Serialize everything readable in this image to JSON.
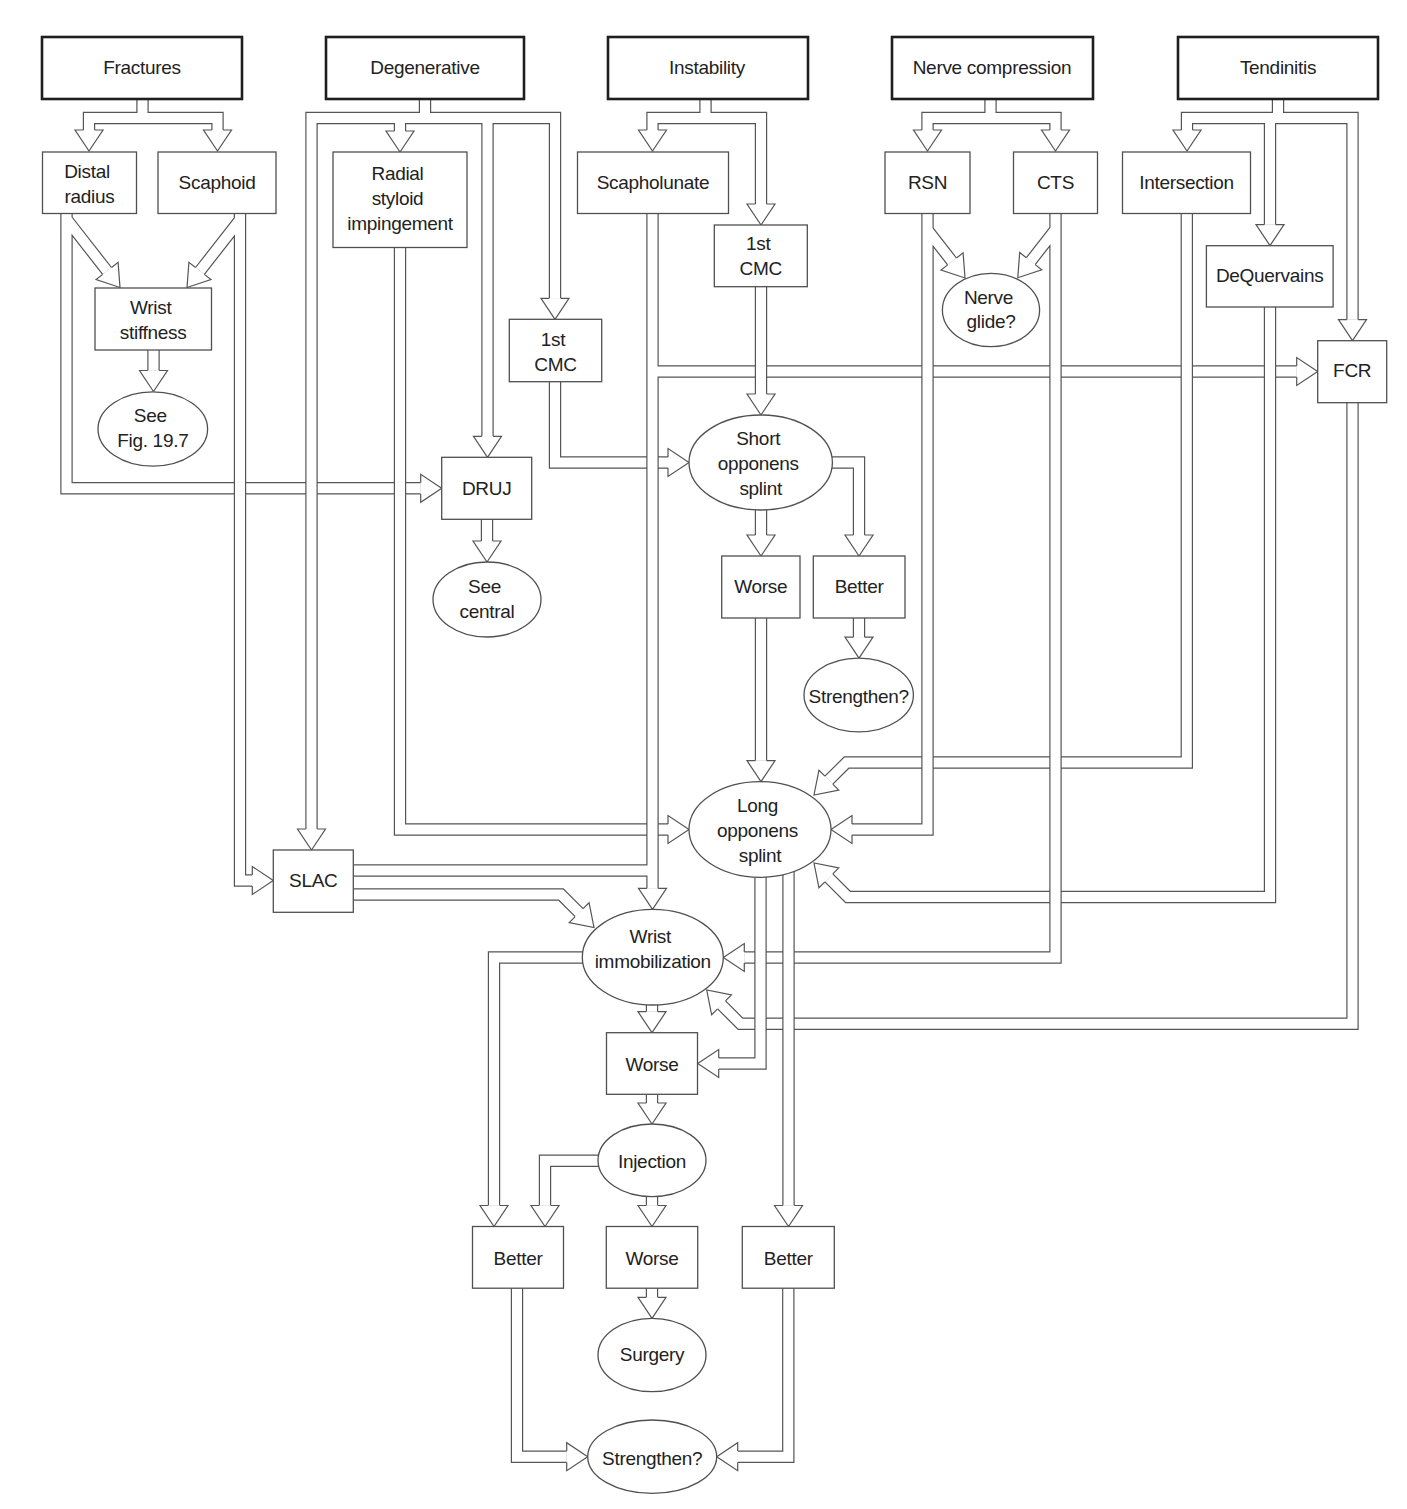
{
  "colors": {
    "background": "#ffffff",
    "connector_line": "#555555",
    "category_border": "#1e1e1e",
    "text": "#222222"
  },
  "nodes": {
    "fractures": {
      "shape": "rect",
      "level": "category",
      "lines": [
        "Fractures"
      ]
    },
    "degenerative": {
      "shape": "rect",
      "level": "category",
      "lines": [
        "Degenerative"
      ]
    },
    "instability": {
      "shape": "rect",
      "level": "category",
      "lines": [
        "Instability"
      ]
    },
    "nerve_compression": {
      "shape": "rect",
      "level": "category",
      "lines": [
        "Nerve compression"
      ]
    },
    "tendinitis": {
      "shape": "rect",
      "level": "category",
      "lines": [
        "Tendinitis"
      ]
    },
    "distal_radius": {
      "shape": "rect",
      "lines": [
        "Distal",
        "radius"
      ]
    },
    "scaphoid": {
      "shape": "rect",
      "lines": [
        "Scaphoid"
      ]
    },
    "radial_styloid_impingement": {
      "shape": "rect",
      "lines": [
        "Radial",
        "styloid",
        "impingement"
      ]
    },
    "scapholunate": {
      "shape": "rect",
      "lines": [
        "Scapholunate"
      ]
    },
    "rsn": {
      "shape": "rect",
      "lines": [
        "RSN"
      ]
    },
    "cts": {
      "shape": "rect",
      "lines": [
        "CTS"
      ]
    },
    "intersection": {
      "shape": "rect",
      "lines": [
        "Intersection"
      ]
    },
    "first_cmc_instability": {
      "shape": "rect",
      "lines": [
        "1st",
        "CMC"
      ]
    },
    "wrist_stiffness": {
      "shape": "rect",
      "lines": [
        "Wrist",
        "stiffness"
      ]
    },
    "first_cmc_degenerative": {
      "shape": "rect",
      "lines": [
        "1st",
        "CMC"
      ]
    },
    "nerve_glide": {
      "shape": "ellipse",
      "lines": [
        "Nerve",
        "glide?"
      ]
    },
    "dequervains": {
      "shape": "rect",
      "lines": [
        "DeQuervains"
      ]
    },
    "fcr": {
      "shape": "rect",
      "lines": [
        "FCR"
      ]
    },
    "see_fig_19_7": {
      "shape": "ellipse",
      "lines": [
        "See",
        "Fig. 19.7"
      ]
    },
    "druj": {
      "shape": "rect",
      "lines": [
        "DRUJ"
      ]
    },
    "short_opponens_splint": {
      "shape": "ellipse",
      "lines": [
        "Short",
        "opponens",
        "splint"
      ]
    },
    "see_central": {
      "shape": "ellipse",
      "lines": [
        "See",
        "central"
      ]
    },
    "worse_1": {
      "shape": "rect",
      "lines": [
        "Worse"
      ]
    },
    "better_1": {
      "shape": "rect",
      "lines": [
        "Better"
      ]
    },
    "strengthen_1": {
      "shape": "ellipse",
      "lines": [
        "Strengthen?"
      ]
    },
    "long_opponens_splint": {
      "shape": "ellipse",
      "lines": [
        "Long",
        "opponens",
        "splint"
      ]
    },
    "slac": {
      "shape": "rect",
      "lines": [
        "SLAC"
      ]
    },
    "wrist_immobilization": {
      "shape": "ellipse",
      "lines": [
        "Wrist",
        "immobilization"
      ]
    },
    "worse_2": {
      "shape": "rect",
      "lines": [
        "Worse"
      ]
    },
    "injection": {
      "shape": "ellipse",
      "lines": [
        "Injection"
      ]
    },
    "better_2": {
      "shape": "rect",
      "lines": [
        "Better"
      ]
    },
    "worse_3": {
      "shape": "rect",
      "lines": [
        "Worse"
      ]
    },
    "better_3": {
      "shape": "rect",
      "lines": [
        "Better"
      ]
    },
    "surgery": {
      "shape": "ellipse",
      "lines": [
        "Surgery"
      ]
    },
    "strengthen_2": {
      "shape": "ellipse",
      "lines": [
        "Strengthen?"
      ]
    }
  },
  "edges": [
    [
      "fractures",
      "distal_radius"
    ],
    [
      "fractures",
      "scaphoid"
    ],
    [
      "degenerative",
      "slac"
    ],
    [
      "degenerative",
      "radial_styloid_impingement"
    ],
    [
      "degenerative",
      "druj"
    ],
    [
      "degenerative",
      "first_cmc_degenerative"
    ],
    [
      "instability",
      "scapholunate"
    ],
    [
      "instability",
      "first_cmc_instability"
    ],
    [
      "nerve_compression",
      "rsn"
    ],
    [
      "nerve_compression",
      "cts"
    ],
    [
      "tendinitis",
      "intersection"
    ],
    [
      "tendinitis",
      "dequervains"
    ],
    [
      "tendinitis",
      "fcr"
    ],
    [
      "distal_radius",
      "wrist_stiffness"
    ],
    [
      "scaphoid",
      "wrist_stiffness"
    ],
    [
      "distal_radius",
      "druj"
    ],
    [
      "scaphoid",
      "slac"
    ],
    [
      "wrist_stiffness",
      "see_fig_19_7"
    ],
    [
      "druj",
      "see_central"
    ],
    [
      "radial_styloid_impingement",
      "long_opponens_splint"
    ],
    [
      "first_cmc_degenerative",
      "short_opponens_splint"
    ],
    [
      "scapholunate",
      "wrist_immobilization"
    ],
    [
      "scapholunate",
      "fcr"
    ],
    [
      "slac",
      "wrist_immobilization"
    ],
    [
      "first_cmc_instability",
      "short_opponens_splint"
    ],
    [
      "short_opponens_splint",
      "worse_1"
    ],
    [
      "short_opponens_splint",
      "better_1"
    ],
    [
      "better_1",
      "strengthen_1"
    ],
    [
      "worse_1",
      "long_opponens_splint"
    ],
    [
      "rsn",
      "nerve_glide"
    ],
    [
      "cts",
      "nerve_glide"
    ],
    [
      "rsn",
      "long_opponens_splint"
    ],
    [
      "intersection",
      "long_opponens_splint"
    ],
    [
      "dequervains",
      "long_opponens_splint"
    ],
    [
      "cts",
      "wrist_immobilization"
    ],
    [
      "fcr",
      "wrist_immobilization"
    ],
    [
      "long_opponens_splint",
      "worse_2"
    ],
    [
      "long_opponens_splint",
      "better_3"
    ],
    [
      "wrist_immobilization",
      "worse_2"
    ],
    [
      "wrist_immobilization",
      "better_2"
    ],
    [
      "worse_2",
      "injection"
    ],
    [
      "injection",
      "better_2"
    ],
    [
      "injection",
      "worse_3"
    ],
    [
      "worse_3",
      "surgery"
    ],
    [
      "better_2",
      "strengthen_2"
    ],
    [
      "better_3",
      "strengthen_2"
    ]
  ]
}
